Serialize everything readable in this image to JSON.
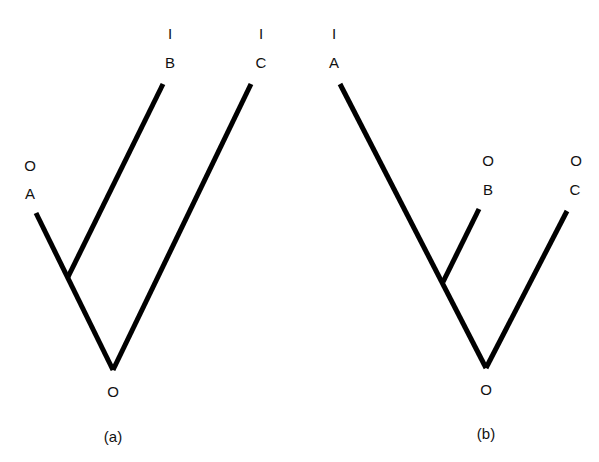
{
  "figure": {
    "line_color": "#000000",
    "panels": [
      {
        "caption": "(a)",
        "root_label": "O",
        "topology": "(A,(B)),C rooted; B branches from A lineage",
        "taxa": [
          {
            "name": "A",
            "state": "O"
          },
          {
            "name": "B",
            "state": "I"
          },
          {
            "name": "C",
            "state": "I"
          }
        ]
      },
      {
        "caption": "(b)",
        "root_label": "O",
        "topology": "B branches from A lineage; C sister",
        "taxa": [
          {
            "name": "A",
            "state": "I"
          },
          {
            "name": "B",
            "state": "O"
          },
          {
            "name": "C",
            "state": "O"
          }
        ]
      }
    ]
  }
}
